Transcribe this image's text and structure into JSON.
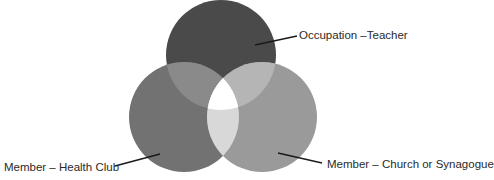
{
  "diagram": {
    "type": "venn",
    "sets": [
      {
        "id": "occupation",
        "label": "Occupation –Teacher",
        "color": "#4a4a4a"
      },
      {
        "id": "health_club",
        "label": "Member – Health Club",
        "color": "#727272"
      },
      {
        "id": "church",
        "label": "Member – Church or Synagogue",
        "color": "#9a9a9a"
      }
    ],
    "intersections": [
      {
        "sets": [
          "occupation",
          "health_club"
        ],
        "color": "#8a8a8a"
      },
      {
        "sets": [
          "occupation",
          "church"
        ],
        "color": "#b5b5b5"
      },
      {
        "sets": [
          "health_club",
          "church"
        ],
        "color": "#d8d8d8"
      },
      {
        "sets": [
          "occupation",
          "health_club",
          "church"
        ],
        "color": "#ffffff"
      }
    ]
  },
  "labels": {
    "occupation": "Occupation –Teacher",
    "health_club": "Member – Health Club",
    "church": "Member – Church or Synagogue"
  }
}
